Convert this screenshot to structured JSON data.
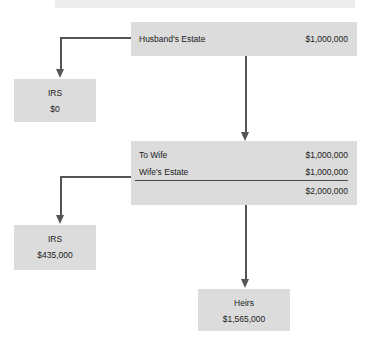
{
  "diagram": {
    "colors": {
      "box_fill": "#dcdcdc",
      "header_fill": "#ededed",
      "connector": "#555555",
      "text": "#1b1b1b"
    },
    "top_bar": {
      "label": ""
    },
    "husband_estate": {
      "label": "Husband's Estate",
      "amount": "$1,000,000"
    },
    "irs_top": {
      "title": "IRS",
      "value": "$0"
    },
    "wife_block": {
      "to_wife": {
        "label": "To Wife",
        "amount": "$1,000,000"
      },
      "wife_estate": {
        "label": "Wife's Estate",
        "amount": "$1,000,000"
      },
      "total": {
        "label": "",
        "amount": "$2,000,000"
      }
    },
    "irs_bottom": {
      "title": "IRS",
      "value": "$435,000"
    },
    "heirs": {
      "title": "Heirs",
      "value": "$1,565,000"
    }
  }
}
